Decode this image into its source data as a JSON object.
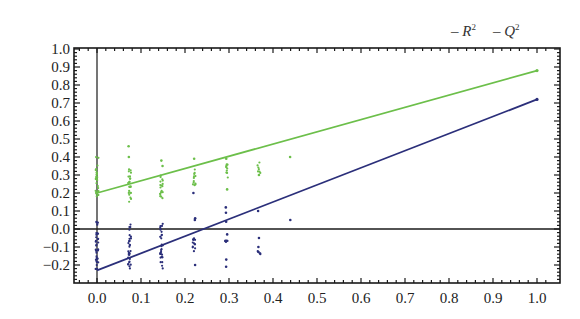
{
  "chart_data": {
    "type": "scatter",
    "title": "",
    "xlabel": "",
    "ylabel": "",
    "xlim": [
      -0.05,
      1.03
    ],
    "ylim": [
      -0.28,
      1.0
    ],
    "x_ticks": [
      "0.0",
      "0.1",
      "0.2",
      "0.3",
      "0.4",
      "0.5",
      "0.6",
      "0.7",
      "0.8",
      "0.9",
      "1.0"
    ],
    "y_ticks": [
      "1.0",
      "0.9",
      "0.8",
      "0.7",
      "0.6",
      "0.5",
      "0.4",
      "0.3",
      "0.2",
      "0.1",
      "0.0",
      "−0.1",
      "−0.2"
    ],
    "grid": false,
    "legend_position": "top-right, outside frame",
    "legend": [
      {
        "label": "R",
        "sup": "2",
        "color": "#6cbf4a"
      },
      {
        "label": "Q",
        "sup": "2",
        "color": "#2b2f7a"
      }
    ],
    "series": [
      {
        "name": "R2",
        "color": "#6cbf4a",
        "regression_line": {
          "x": [
            0.0,
            1.0
          ],
          "y": [
            0.2,
            0.88
          ]
        },
        "points": [
          {
            "x": 0.0,
            "y_range": [
              0.17,
              0.41
            ]
          },
          {
            "x": 0.074,
            "y_range": [
              0.15,
              0.34
            ]
          },
          {
            "x": 0.074,
            "y": 0.46
          },
          {
            "x": 0.074,
            "y": 0.4
          },
          {
            "x": 0.147,
            "y_range": [
              0.17,
              0.32
            ]
          },
          {
            "x": 0.147,
            "y": 0.38
          },
          {
            "x": 0.147,
            "y": 0.35
          },
          {
            "x": 0.221,
            "y_range": [
              0.24,
              0.34
            ]
          },
          {
            "x": 0.221,
            "y": 0.39
          },
          {
            "x": 0.294,
            "y_range": [
              0.28,
              0.36
            ]
          },
          {
            "x": 0.294,
            "y": 0.39
          },
          {
            "x": 0.294,
            "y": 0.22
          },
          {
            "x": 0.368,
            "y_range": [
              0.31,
              0.37
            ]
          },
          {
            "x": 0.368,
            "y": 0.3
          },
          {
            "x": 0.441,
            "y": 0.4
          }
        ]
      },
      {
        "name": "Q2",
        "color": "#2b2f7a",
        "regression_line": {
          "x": [
            0.0,
            1.0
          ],
          "y": [
            -0.23,
            0.72
          ]
        },
        "points": [
          {
            "x": 0.0,
            "y_range": [
              -0.23,
              0.05
            ]
          },
          {
            "x": 0.074,
            "y_range": [
              -0.22,
              0.03
            ]
          },
          {
            "x": 0.147,
            "y_range": [
              -0.22,
              0.03
            ]
          },
          {
            "x": 0.221,
            "y_range": [
              -0.13,
              -0.03
            ]
          },
          {
            "x": 0.221,
            "y": 0.2
          },
          {
            "x": 0.221,
            "y": 0.06
          },
          {
            "x": 0.221,
            "y": 0.05
          },
          {
            "x": 0.221,
            "y": -0.2
          },
          {
            "x": 0.294,
            "y": 0.12
          },
          {
            "x": 0.294,
            "y": 0.09
          },
          {
            "x": 0.294,
            "y": 0.04
          },
          {
            "x": 0.294,
            "y": -0.03
          },
          {
            "x": 0.294,
            "y_range": [
              -0.08,
              -0.06
            ]
          },
          {
            "x": 0.294,
            "y": -0.17
          },
          {
            "x": 0.294,
            "y": -0.21
          },
          {
            "x": 0.368,
            "y": 0.1
          },
          {
            "x": 0.368,
            "y": -0.05
          },
          {
            "x": 0.368,
            "y": -0.1
          },
          {
            "x": 0.368,
            "y_range": [
              -0.14,
              -0.12
            ]
          },
          {
            "x": 0.441,
            "y": 0.05
          }
        ]
      }
    ]
  }
}
